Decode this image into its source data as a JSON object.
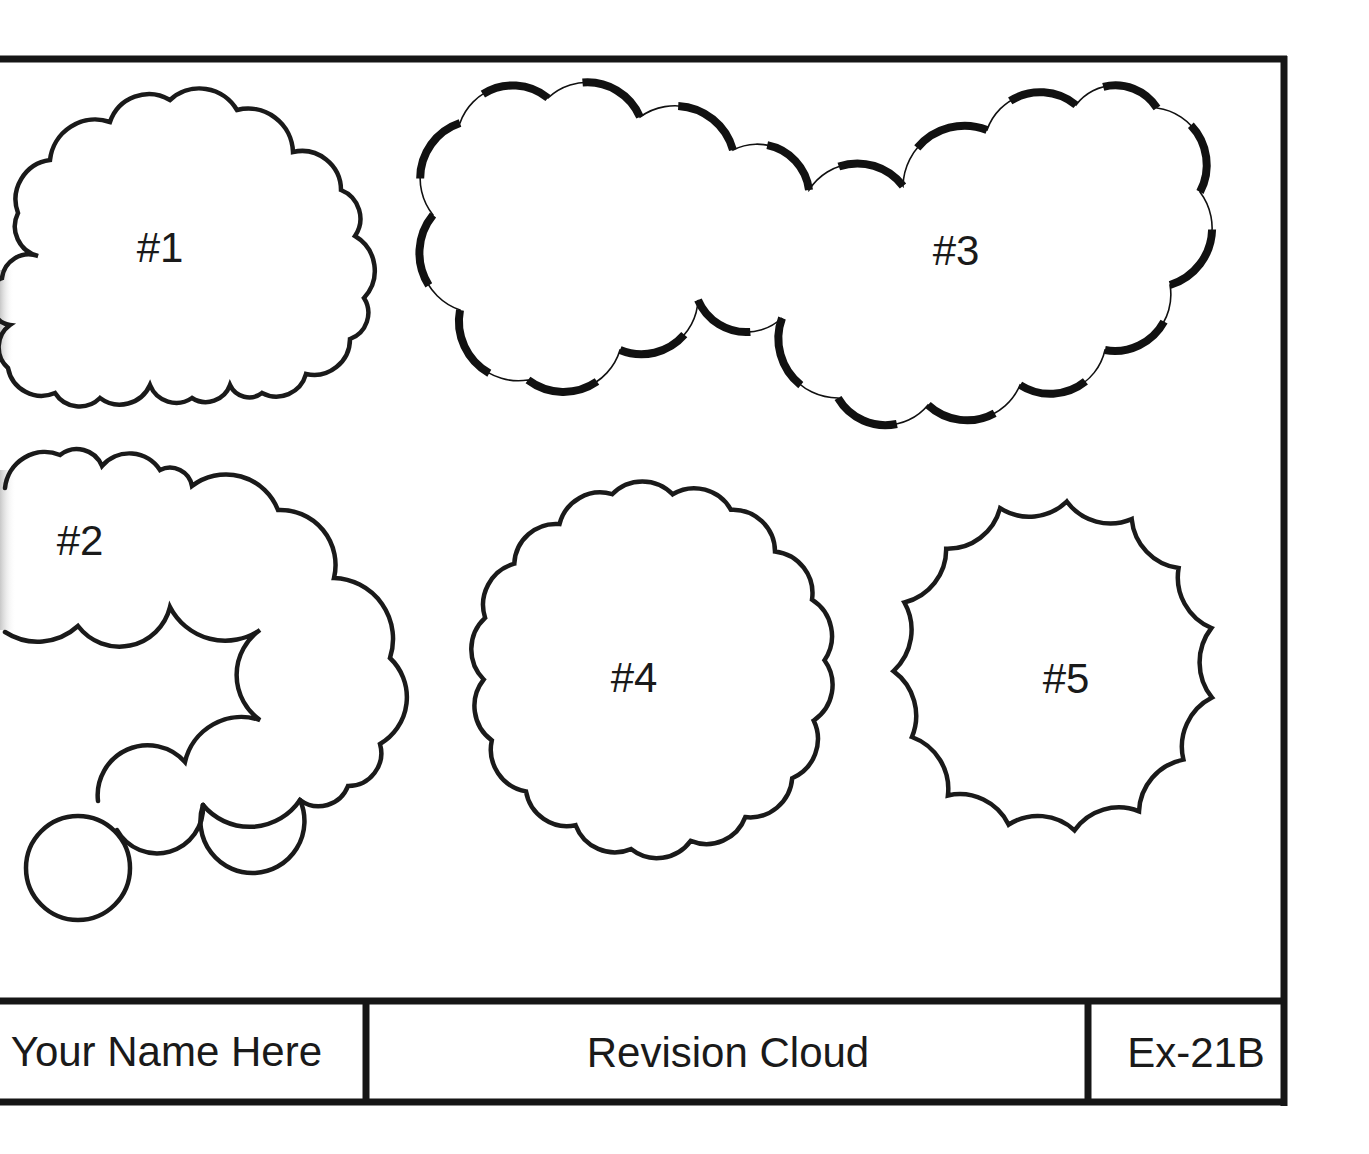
{
  "drawing": {
    "title_block": {
      "name_field": "Your Name Here",
      "title_field": "Revision Cloud",
      "sheet_id": "Ex-21B"
    },
    "colors": {
      "line": "#1a1a1a",
      "paper": "#ffffff"
    },
    "clouds": [
      {
        "id": "cloud-1",
        "label": "#1",
        "style": "normal",
        "label_pos": [
          160,
          262
        ]
      },
      {
        "id": "cloud-2",
        "label": "#2",
        "style": "normal",
        "label_pos": [
          80,
          555
        ]
      },
      {
        "id": "cloud-3",
        "label": "#3",
        "style": "calligraphy",
        "label_pos": [
          956,
          265
        ]
      },
      {
        "id": "cloud-4",
        "label": "#4",
        "style": "normal",
        "label_pos": [
          634,
          692
        ]
      },
      {
        "id": "cloud-5",
        "label": "#5",
        "style": "inverted",
        "label_pos": [
          1066,
          693
        ]
      }
    ]
  }
}
